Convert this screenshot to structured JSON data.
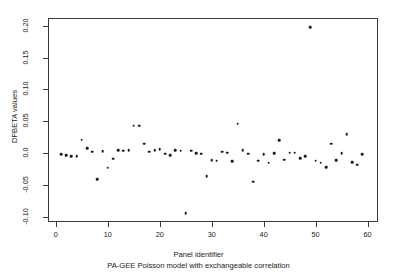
{
  "chart_data": {
    "type": "scatter",
    "title": "",
    "xlabel": "Panel identifier",
    "ylabel": "DFBETA values",
    "subtitle": "PA-GEE Poisson model with exchangeable correlation",
    "xlim": [
      -1.5,
      62.0
    ],
    "ylim": [
      -0.108,
      0.212
    ],
    "xticks": [
      0,
      10,
      20,
      30,
      40,
      50,
      60
    ],
    "xtick_labels": [
      "0",
      "10",
      "20",
      "30",
      "40",
      "50",
      "60"
    ],
    "yticks": [
      0.2,
      0.15,
      0.1,
      0.05,
      0.0,
      -0.05,
      -0.1
    ],
    "ytick_labels": [
      "0.20",
      "0.15",
      "0.10",
      "0.05",
      "0.0",
      "-0.05",
      "-0.10"
    ],
    "grid": false,
    "legend": null,
    "marker": "filled-circle",
    "marker_color": "#1b1b1b",
    "frame_color": "#3a3a3a",
    "background": "#ffffff",
    "x": [
      1,
      2,
      3,
      4,
      5,
      6,
      7,
      8,
      9,
      10,
      11,
      12,
      13,
      14,
      15,
      16,
      17,
      18,
      19,
      20,
      21,
      22,
      23,
      24,
      25,
      26,
      27,
      28,
      29,
      30,
      31,
      32,
      33,
      34,
      35,
      36,
      37,
      38,
      39,
      40,
      41,
      42,
      43,
      44,
      45,
      46,
      47,
      48,
      49,
      50,
      51,
      52,
      53,
      54,
      55,
      56,
      57,
      58,
      59
    ],
    "y": [
      -0.002,
      -0.003,
      -0.005,
      -0.005,
      0.021,
      0.008,
      0.002,
      -0.041,
      0.003,
      -0.023,
      -0.009,
      0.005,
      0.004,
      0.005,
      0.043,
      0.043,
      0.015,
      0.002,
      0.005,
      0.006,
      -0.001,
      -0.003,
      0.005,
      0.004,
      -0.094,
      0.004,
      0.0,
      -0.001,
      -0.036,
      -0.011,
      -0.012,
      0.002,
      0.001,
      -0.013,
      0.046,
      0.005,
      -0.001,
      -0.045,
      -0.012,
      -0.002,
      -0.015,
      0.0,
      0.02,
      -0.01,
      0.001,
      0.001,
      -0.008,
      -0.005,
      0.198,
      -0.012,
      -0.015,
      -0.022,
      0.015,
      -0.011,
      0.0,
      0.03,
      -0.014,
      -0.018,
      -0.002
    ]
  },
  "axes": {
    "x_axis_name": "panel-identifier-axis",
    "y_axis_name": "dfbeta-values-axis"
  }
}
